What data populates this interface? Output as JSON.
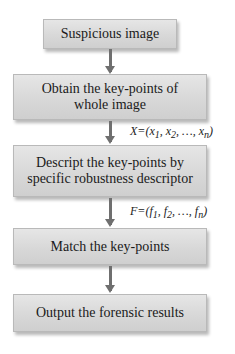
{
  "flowchart": {
    "steps": [
      {
        "label": "Suspicious image"
      },
      {
        "label": "Obtain the key-points of whole image"
      },
      {
        "label": "Descript the key-points by specific robustness descriptor"
      },
      {
        "label": "Match the key-points"
      },
      {
        "label": "Output the forensic results"
      }
    ],
    "edge_labels": [
      "",
      "X=(x1, x2, …, xn)",
      "F=(f1, f2, …, fn)",
      ""
    ]
  }
}
